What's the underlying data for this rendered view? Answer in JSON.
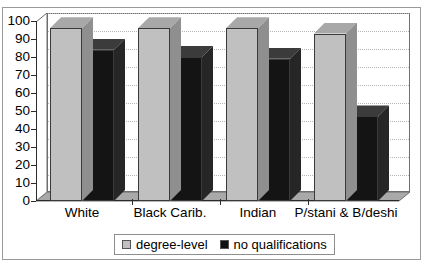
{
  "chart_data": {
    "type": "bar",
    "title": "",
    "xlabel": "",
    "ylabel": "",
    "ylim": [
      0,
      100
    ],
    "yticks": [
      100,
      90,
      80,
      70,
      60,
      50,
      40,
      30,
      20,
      10,
      0
    ],
    "grid": true,
    "legend_position": "bottom",
    "categories": [
      "White",
      "Black Carib.",
      "Indian",
      "P/stani & B/deshi"
    ],
    "series": [
      {
        "name": "degree-level",
        "color": "#c0c0c0",
        "values": [
          96,
          96,
          96,
          93
        ]
      },
      {
        "name": "no qualifications",
        "color": "#111111",
        "values": [
          84,
          80,
          79,
          47
        ]
      }
    ]
  },
  "axis": {
    "y_tick_labels": [
      "100",
      "90",
      "80",
      "70",
      "60",
      "50",
      "40",
      "30",
      "20",
      "10",
      "0"
    ],
    "x_tick_labels": [
      "White",
      "Black Carib.",
      "Indian",
      "P/stani & B/deshi"
    ]
  },
  "legend": {
    "items": [
      {
        "label": "degree-level",
        "swatch": "gray-swatch-icon"
      },
      {
        "label": "no qualifications",
        "swatch": "black-swatch-icon"
      }
    ]
  },
  "colors": {
    "series_gray": "#c0c0c0",
    "series_black": "#111111",
    "gridline": "#b4b4b4",
    "axis": "#2b2b2b",
    "frame": "#9a9a9a",
    "background": "#ffffff"
  }
}
